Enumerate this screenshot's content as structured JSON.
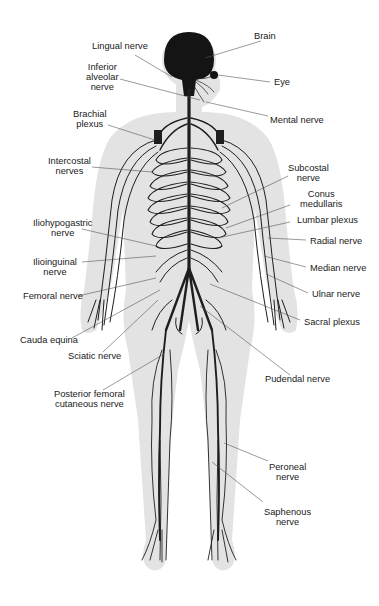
{
  "labels": {
    "brain": "Brain",
    "lingual_nerve": "Lingual nerve",
    "eye": "Eye",
    "inferior_alveolar_nerve": "Inferior\nalveolar\nnerve",
    "mental_nerve": "Mental nerve",
    "brachial_plexus": "Brachial\nplexus",
    "intercostal_nerves": "Intercostal\nnerves",
    "subcostal_nerve": "Subcostal\nnerve",
    "conus_medullaris": "Conus\nmedullaris",
    "lumbar_plexus": "Lumbar plexus",
    "iliohypogastric_nerve": "Iliohypogastric\nnerve",
    "radial_nerve": "Radial nerve",
    "ilioinguinal_nerve": "Ilioinguinal\nnerve",
    "median_nerve": "Median nerve",
    "femoral_nerve": "Femoral nerve",
    "ulnar_nerve": "Ulnar nerve",
    "sacral_plexus": "Sacral plexus",
    "cauda_equina": "Cauda equina",
    "sciatic_nerve": "Sciatic nerve",
    "pudendal_nerve": "Pudendal nerve",
    "posterior_femoral_cutaneous_nerve": "Posterior femoral\ncutaneous nerve",
    "peroneal_nerve": "Peroneal\nnerve",
    "saphenous_nerve": "Saphenous\nnerve"
  },
  "colors": {
    "body_silhouette": "#e3e3e3",
    "nerves": "#1e1e1e",
    "leader_lines": "#555555",
    "text": "#1a1a1a"
  }
}
